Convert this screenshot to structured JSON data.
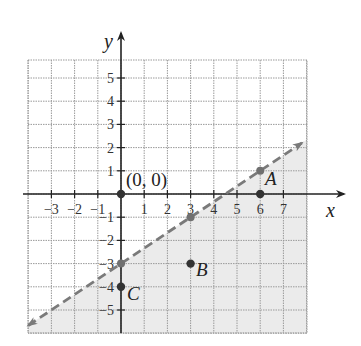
{
  "chart_data": {
    "type": "line",
    "title": "",
    "xlabel": "x",
    "ylabel": "y",
    "xlim": [
      -4,
      8
    ],
    "ylim": [
      -6,
      6
    ],
    "grid": true,
    "x_ticks": [
      -3,
      -2,
      -1,
      1,
      2,
      3,
      4,
      5,
      6,
      7
    ],
    "y_ticks": [
      5,
      4,
      3,
      2,
      1,
      -1,
      -2,
      -3,
      -4,
      -5
    ],
    "boundary_line": {
      "equation": "y = (2/3)x - 3",
      "slope": 0.6667,
      "intercept": -3,
      "style": "dashed",
      "arrows": "both",
      "x_range": [
        -4,
        7.8
      ]
    },
    "shaded_region": "below line",
    "line_points": [
      {
        "x": 0,
        "y": -3
      },
      {
        "x": 3,
        "y": -1
      },
      {
        "x": 6,
        "y": 1
      }
    ],
    "points": [
      {
        "label": "(0, 0)",
        "x": 0,
        "y": 0
      },
      {
        "label": "A",
        "x": 6,
        "y": 0
      },
      {
        "label": "B",
        "x": 3,
        "y": -3
      },
      {
        "label": "C",
        "x": 0,
        "y": -4
      }
    ]
  },
  "labels": {
    "x_axis": "x",
    "y_axis": "y",
    "origin": "(0, 0)",
    "A": "A",
    "B": "B",
    "C": "C"
  },
  "colors": {
    "shade": "#ebebeb",
    "grid": "#9a9a9a",
    "axis": "#222222",
    "dashed_line": "#7a7a7a",
    "point": "#333333",
    "line_point": "#707070"
  }
}
